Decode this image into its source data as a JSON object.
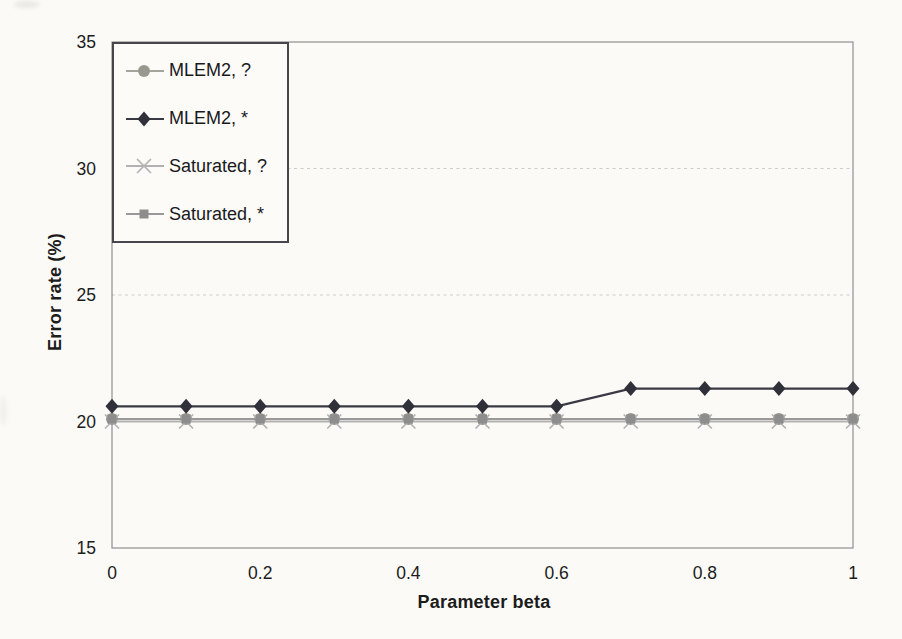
{
  "figure": {
    "background": "#fbfaf7",
    "frame_color": "#909090",
    "grid_color": "#cccccc",
    "text_color": "#1c1c1c",
    "legend_border_color": "#46464c"
  },
  "chart_data": {
    "type": "line",
    "title": "",
    "xlabel": "Parameter beta",
    "ylabel": "Error rate (%)",
    "x": [
      0,
      0.1,
      0.2,
      0.3,
      0.4,
      0.5,
      0.6,
      0.7,
      0.8,
      0.9,
      1
    ],
    "xlim": [
      0,
      1
    ],
    "ylim": [
      15,
      35
    ],
    "xticks": [
      "0",
      "0.2",
      "0.4",
      "0.6",
      "0.8",
      "1"
    ],
    "xtick_values": [
      0,
      0.2,
      0.4,
      0.6,
      0.8,
      1
    ],
    "yticks": [
      "15",
      "20",
      "25",
      "30",
      "35"
    ],
    "ytick_values": [
      15,
      20,
      25,
      30,
      35
    ],
    "grid": "horizontal dashed major gridlines",
    "legend_position": "top-left inside plot area",
    "series": [
      {
        "name": "MLEM2, ?",
        "marker": "circle",
        "color": "#98988f",
        "line_color": "#a4a49c",
        "values": [
          20.1,
          20.1,
          20.1,
          20.1,
          20.1,
          20.1,
          20.1,
          20.1,
          20.1,
          20.1,
          20.1
        ]
      },
      {
        "name": "MLEM2, *",
        "marker": "diamond",
        "color": "#30303a",
        "line_color": "#3a3a44",
        "values": [
          20.6,
          20.6,
          20.6,
          20.6,
          20.6,
          20.6,
          20.6,
          21.3,
          21.3,
          21.3,
          21.3
        ]
      },
      {
        "name": "Saturated, ?",
        "marker": "x",
        "color": "#b2b2b2",
        "line_color": "#b2b2b2",
        "values": [
          20,
          20,
          20,
          20,
          20,
          20,
          20,
          20,
          20,
          20,
          20
        ]
      },
      {
        "name": "Saturated, *",
        "marker": "square",
        "color": "#8d8d8d",
        "line_color": "#999999",
        "values": [
          20.1,
          20.1,
          20.1,
          20.1,
          20.1,
          20.1,
          20.1,
          20.1,
          20.1,
          20.1,
          20.1
        ]
      }
    ]
  }
}
